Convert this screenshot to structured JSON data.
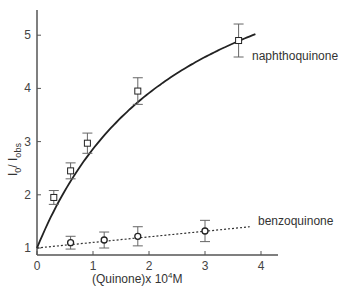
{
  "chart_data": {
    "type": "line",
    "title": "",
    "xlabel": "(Quinone)x 10^4 M",
    "xlabel_parts": {
      "pre": "(Quinone)x 10",
      "sup": "4",
      "post": "M"
    },
    "ylabel": "I0 / Iobs",
    "ylabel_parts": {
      "a": "I",
      "a_sub": "0",
      "sep": "/ ",
      "b": "I",
      "b_sub": "obs"
    },
    "xlim": [
      0,
      4.3
    ],
    "ylim": [
      1,
      5.5
    ],
    "x_ticks": [
      0,
      1,
      2,
      3,
      4
    ],
    "y_ticks": [
      1,
      2,
      3,
      4,
      5
    ],
    "grid": false,
    "series": [
      {
        "name": "naphthoquinone",
        "marker": "square",
        "line": "solid",
        "x": [
          0.3,
          0.6,
          0.9,
          1.8,
          3.6
        ],
        "y": [
          1.95,
          2.45,
          2.97,
          3.95,
          4.9
        ],
        "error": [
          0.13,
          0.15,
          0.19,
          0.25,
          0.31
        ],
        "fit": "hyperbolic through (0,1)"
      },
      {
        "name": "benzoquinone",
        "marker": "circle",
        "line": "dotted",
        "x": [
          0.6,
          1.2,
          1.8,
          3.0
        ],
        "y": [
          1.1,
          1.15,
          1.22,
          1.32
        ],
        "error": [
          0.12,
          0.15,
          0.18,
          0.2
        ],
        "fit": "linear through (0,1)"
      }
    ]
  }
}
